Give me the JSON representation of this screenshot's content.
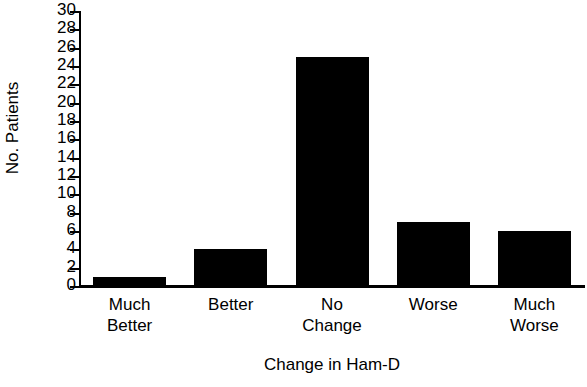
{
  "chart_data": {
    "type": "bar",
    "title": "",
    "xlabel": "Change in Ham-D",
    "ylabel": "No. Patients",
    "categories": [
      "Much\nBetter",
      "Better",
      "No\nChange",
      "Worse",
      "Much\nWorse"
    ],
    "values": [
      1,
      4,
      25,
      7,
      6
    ],
    "ylim": [
      0,
      30
    ],
    "ytick_step": 2,
    "yticks": [
      0,
      2,
      4,
      6,
      8,
      10,
      12,
      14,
      16,
      18,
      20,
      22,
      24,
      26,
      28,
      30
    ],
    "ytick_labels": [
      "0",
      "2",
      "4",
      "6",
      "8",
      "10",
      "12",
      "14",
      "16",
      "18",
      "20",
      "22",
      "24",
      "26",
      "28",
      "30"
    ],
    "grid": false,
    "legend": null,
    "bar_color": "#000000",
    "axis_color": "#000000",
    "background": "#ffffff"
  },
  "axes": {
    "y_title": "No. Patients",
    "x_title": "Change in Ham-D"
  }
}
